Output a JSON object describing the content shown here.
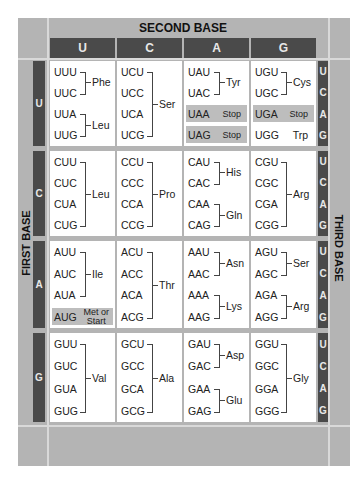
{
  "title": "SECOND BASE",
  "first_base_label": "FIRST BASE",
  "third_base_label": "THIRD BASE",
  "second_bases": [
    "U",
    "C",
    "A",
    "G"
  ],
  "first_bases": [
    "U",
    "C",
    "A",
    "G"
  ],
  "third_bases": [
    "U",
    "C",
    "A",
    "G"
  ],
  "colors": {
    "frame": "#b4b4b4",
    "dark_strip": "#4a4a4a",
    "cell": "#ffffff",
    "highlight": "#bdbdbd"
  },
  "rows": [
    {
      "first": "U",
      "cells": [
        {
          "codons": [
            "UUU",
            "UUC",
            "UUA",
            "UUG"
          ],
          "groups": [
            {
              "aa": "Phe",
              "span": [
                0,
                1
              ]
            },
            {
              "aa": "Leu",
              "span": [
                2,
                3
              ]
            }
          ]
        },
        {
          "codons": [
            "UCU",
            "UCC",
            "UCA",
            "UCG"
          ],
          "groups": [
            {
              "aa": "Ser",
              "span": [
                0,
                3
              ]
            }
          ]
        },
        {
          "codons": [
            "UAU",
            "UAC",
            "UAA",
            "UAG"
          ],
          "groups": [
            {
              "aa": "Tyr",
              "span": [
                0,
                1
              ]
            }
          ],
          "special": [
            {
              "index": 2,
              "label": "Stop"
            },
            {
              "index": 3,
              "label": "Stop"
            }
          ]
        },
        {
          "codons": [
            "UGU",
            "UGC",
            "UGA",
            "UGG"
          ],
          "groups": [
            {
              "aa": "Cys",
              "span": [
                0,
                1
              ]
            }
          ],
          "special": [
            {
              "index": 2,
              "label": "Stop"
            }
          ],
          "single": [
            {
              "index": 3,
              "label": "Trp"
            }
          ]
        }
      ]
    },
    {
      "first": "C",
      "cells": [
        {
          "codons": [
            "CUU",
            "CUC",
            "CUA",
            "CUG"
          ],
          "groups": [
            {
              "aa": "Leu",
              "span": [
                0,
                3
              ]
            }
          ]
        },
        {
          "codons": [
            "CCU",
            "CCC",
            "CCA",
            "CCG"
          ],
          "groups": [
            {
              "aa": "Pro",
              "span": [
                0,
                3
              ]
            }
          ]
        },
        {
          "codons": [
            "CAU",
            "CAC",
            "CAA",
            "CAG"
          ],
          "groups": [
            {
              "aa": "His",
              "span": [
                0,
                1
              ]
            },
            {
              "aa": "Gln",
              "span": [
                2,
                3
              ]
            }
          ]
        },
        {
          "codons": [
            "CGU",
            "CGC",
            "CGA",
            "CGG"
          ],
          "groups": [
            {
              "aa": "Arg",
              "span": [
                0,
                3
              ]
            }
          ]
        }
      ]
    },
    {
      "first": "A",
      "cells": [
        {
          "codons": [
            "AUU",
            "AUC",
            "AUA",
            "AUG"
          ],
          "groups": [
            {
              "aa": "Ile",
              "span": [
                0,
                2
              ]
            }
          ],
          "special": [
            {
              "index": 3,
              "label": "Met or Start"
            }
          ]
        },
        {
          "codons": [
            "ACU",
            "ACC",
            "ACA",
            "ACG"
          ],
          "groups": [
            {
              "aa": "Thr",
              "span": [
                0,
                3
              ]
            }
          ]
        },
        {
          "codons": [
            "AAU",
            "AAC",
            "AAA",
            "AAG"
          ],
          "groups": [
            {
              "aa": "Asn",
              "span": [
                0,
                1
              ]
            },
            {
              "aa": "Lys",
              "span": [
                2,
                3
              ]
            }
          ]
        },
        {
          "codons": [
            "AGU",
            "AGC",
            "AGA",
            "AGG"
          ],
          "groups": [
            {
              "aa": "Ser",
              "span": [
                0,
                1
              ]
            },
            {
              "aa": "Arg",
              "span": [
                2,
                3
              ]
            }
          ]
        }
      ]
    },
    {
      "first": "G",
      "cells": [
        {
          "codons": [
            "GUU",
            "GUC",
            "GUA",
            "GUG"
          ],
          "groups": [
            {
              "aa": "Val",
              "span": [
                0,
                3
              ]
            }
          ]
        },
        {
          "codons": [
            "GCU",
            "GCC",
            "GCA",
            "GCG"
          ],
          "groups": [
            {
              "aa": "Ala",
              "span": [
                0,
                3
              ]
            }
          ]
        },
        {
          "codons": [
            "GAU",
            "GAC",
            "GAA",
            "GAG"
          ],
          "groups": [
            {
              "aa": "Asp",
              "span": [
                0,
                1
              ]
            },
            {
              "aa": "Glu",
              "span": [
                2,
                3
              ]
            }
          ]
        },
        {
          "codons": [
            "GGU",
            "GGC",
            "GGA",
            "GGG"
          ],
          "groups": [
            {
              "aa": "Gly",
              "span": [
                0,
                3
              ]
            }
          ]
        }
      ]
    }
  ]
}
